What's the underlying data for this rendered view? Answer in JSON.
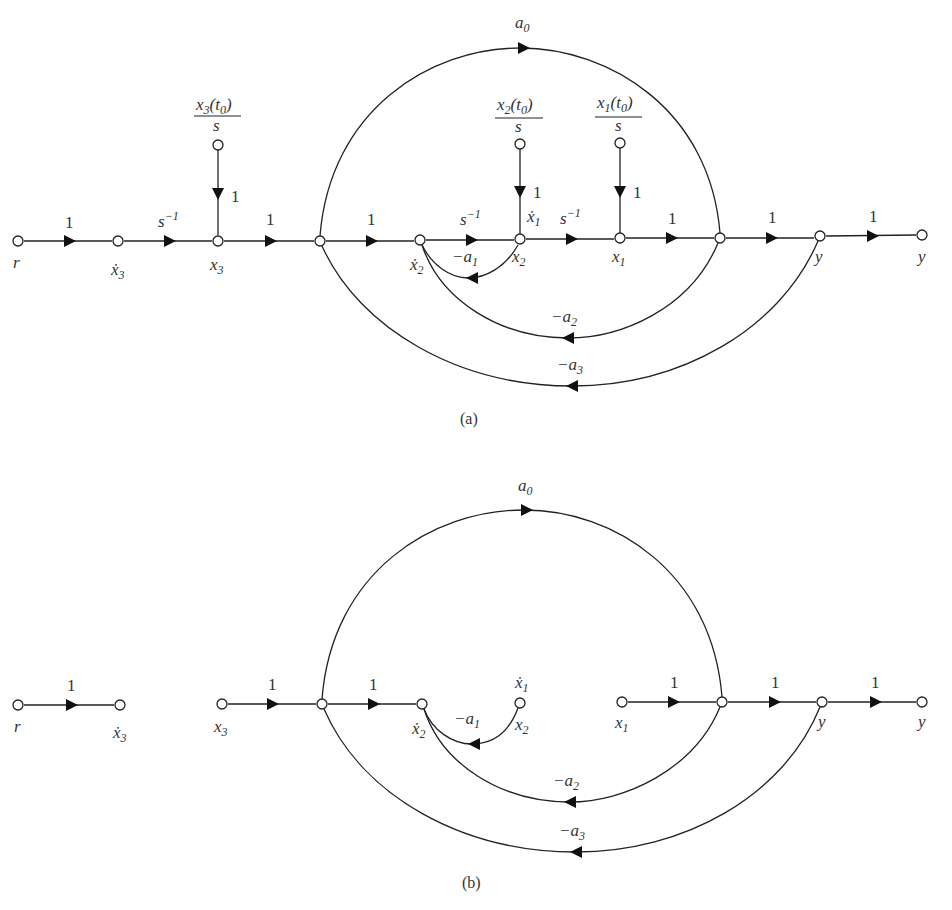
{
  "figure": {
    "panels": [
      {
        "id": "a",
        "caption": "(a)",
        "nodes": [
          {
            "id": "r",
            "label": "r"
          },
          {
            "id": "x3dot",
            "label": "ẋ",
            "sub": "3"
          },
          {
            "id": "x3",
            "label": "x",
            "sub": "3"
          },
          {
            "id": "n4",
            "label": ""
          },
          {
            "id": "x2dot",
            "label": "ẋ",
            "sub": "2"
          },
          {
            "id": "x2",
            "label": "x",
            "sub": "2",
            "extra_label": "ẋ",
            "extra_sub": "1"
          },
          {
            "id": "x1",
            "label": "x",
            "sub": "1"
          },
          {
            "id": "n8",
            "label": ""
          },
          {
            "id": "y1",
            "label": "y"
          },
          {
            "id": "y2",
            "label": "y"
          }
        ],
        "initial_conditions": [
          {
            "target": "x3",
            "numerator": "x",
            "num_sub": "3",
            "num_arg": "(t",
            "arg_sub": "0",
            "arg_close": ")",
            "denominator": "s",
            "gain": "1"
          },
          {
            "target": "x2",
            "numerator": "x",
            "num_sub": "2",
            "num_arg": "(t",
            "arg_sub": "0",
            "arg_close": ")",
            "denominator": "s",
            "gain": "1"
          },
          {
            "target": "x1",
            "numerator": "x",
            "num_sub": "1",
            "num_arg": "(t",
            "arg_sub": "0",
            "arg_close": ")",
            "denominator": "s",
            "gain": "1"
          }
        ],
        "branches": [
          {
            "from": "r",
            "to": "x3dot",
            "gain": "1"
          },
          {
            "from": "x3dot",
            "to": "x3",
            "gain": "s",
            "gain_sup": "−1"
          },
          {
            "from": "x3",
            "to": "n4",
            "gain": "1"
          },
          {
            "from": "n4",
            "to": "x2dot",
            "gain": "1"
          },
          {
            "from": "x2dot",
            "to": "x2",
            "gain": "s",
            "gain_sup": "−1"
          },
          {
            "from": "x2",
            "to": "x1",
            "gain": "s",
            "gain_sup": "−1"
          },
          {
            "from": "x1",
            "to": "n8",
            "gain": "1"
          },
          {
            "from": "n8",
            "to": "y1",
            "gain": "1"
          },
          {
            "from": "y1",
            "to": "y2",
            "gain": "1"
          },
          {
            "from": "n4",
            "to": "n8",
            "gain": "a",
            "gain_sub": "0",
            "type": "feedforward"
          },
          {
            "from": "x2",
            "to": "x2dot",
            "gain": "−a",
            "gain_sub": "1",
            "type": "feedback"
          },
          {
            "from": "n8",
            "to": "x2dot",
            "gain": "−a",
            "gain_sub": "2",
            "type": "feedback"
          },
          {
            "from": "y1",
            "to": "n4",
            "gain": "−a",
            "gain_sub": "3",
            "type": "feedback"
          }
        ]
      },
      {
        "id": "b",
        "caption": "(b)",
        "nodes": [
          {
            "id": "r",
            "label": "r"
          },
          {
            "id": "x3dot",
            "label": "ẋ",
            "sub": "3"
          },
          {
            "id": "x3",
            "label": "x",
            "sub": "3"
          },
          {
            "id": "n4",
            "label": ""
          },
          {
            "id": "x2dot",
            "label": "ẋ",
            "sub": "2"
          },
          {
            "id": "x2",
            "label": "x",
            "sub": "2",
            "extra_label": "ẋ",
            "extra_sub": "1"
          },
          {
            "id": "x1",
            "label": "x",
            "sub": "1"
          },
          {
            "id": "n8",
            "label": ""
          },
          {
            "id": "y1",
            "label": "y"
          },
          {
            "id": "y2",
            "label": "y"
          }
        ],
        "branches": [
          {
            "from": "r",
            "to": "x3dot",
            "gain": "1"
          },
          {
            "from": "x3",
            "to": "n4",
            "gain": "1"
          },
          {
            "from": "n4",
            "to": "x2dot",
            "gain": "1"
          },
          {
            "from": "x1",
            "to": "n8",
            "gain": "1"
          },
          {
            "from": "n8",
            "to": "y1",
            "gain": "1"
          },
          {
            "from": "y1",
            "to": "y2",
            "gain": "1"
          },
          {
            "from": "n4",
            "to": "n8",
            "gain": "a",
            "gain_sub": "0",
            "type": "feedforward"
          },
          {
            "from": "x2",
            "to": "x2dot",
            "gain": "−a",
            "gain_sub": "1",
            "type": "feedback"
          },
          {
            "from": "n8",
            "to": "x2dot",
            "gain": "−a",
            "gain_sub": "2",
            "type": "feedback"
          },
          {
            "from": "y1",
            "to": "n4",
            "gain": "−a",
            "gain_sub": "3",
            "type": "feedback"
          }
        ]
      }
    ]
  }
}
